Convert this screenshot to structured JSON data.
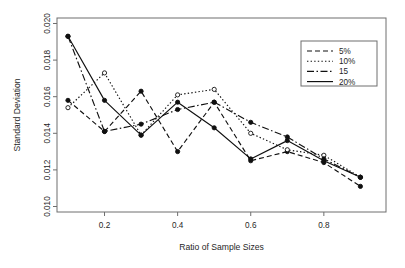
{
  "chart_data": {
    "type": "line",
    "title": "",
    "xlabel": "Ratio of Sample Sizes",
    "ylabel": "Standard Deviation",
    "x": [
      0.1,
      0.2,
      0.3,
      0.4,
      0.5,
      0.6,
      0.7,
      0.8,
      0.9
    ],
    "xlim": [
      0.07,
      0.97
    ],
    "ylim": [
      0.0097,
      0.0203
    ],
    "xticks": [
      0.2,
      0.4,
      0.6,
      0.8
    ],
    "xtick_labels": [
      "0.2",
      "0.4",
      "0.6",
      "0.8"
    ],
    "yticks": [
      0.01,
      0.012,
      0.014,
      0.016,
      0.018,
      0.02
    ],
    "ytick_labels": [
      "0.010",
      "0.012",
      "0.014",
      "0.016",
      "0.018",
      "0.020"
    ],
    "grid": false,
    "legend_position": "top-right",
    "series": [
      {
        "name": "5%",
        "linestyle": "dashed",
        "dash_pattern": "5,3",
        "marker": "circle-filled",
        "values": [
          0.0158,
          0.0141,
          0.0163,
          0.013,
          0.0157,
          0.0125,
          0.013,
          0.0124,
          0.0111
        ]
      },
      {
        "name": "10%",
        "linestyle": "dotted",
        "dash_pattern": "1.4,2.2",
        "marker": "circle-open",
        "values": [
          0.0154,
          0.0173,
          0.0139,
          0.0161,
          0.0164,
          0.014,
          0.0131,
          0.0128,
          0.0116
        ]
      },
      {
        "name": "15",
        "linestyle": "dash-dot",
        "dash_pattern": "7,2.5,1.5,2.5",
        "marker": "circle-filled",
        "values": [
          0.0193,
          0.0141,
          0.0145,
          0.0153,
          0.0157,
          0.0146,
          0.0138,
          0.0126,
          0.0116
        ]
      },
      {
        "name": "20%",
        "linestyle": "solid",
        "dash_pattern": "none",
        "marker": "circle-filled",
        "values": [
          0.0193,
          0.0158,
          0.0139,
          0.0157,
          0.0143,
          0.0126,
          0.0136,
          0.0125,
          0.0116
        ]
      }
    ]
  },
  "legend": {
    "entries": [
      {
        "label": "5%"
      },
      {
        "label": "10%"
      },
      {
        "label": "15"
      },
      {
        "label": "20%"
      }
    ]
  },
  "axes": {
    "x_title": "Ratio of Sample Sizes",
    "y_title": "Standard Deviation"
  },
  "colors": {
    "ink": "#101010",
    "frame": "#6e6e6e",
    "background": "#ffffff"
  }
}
